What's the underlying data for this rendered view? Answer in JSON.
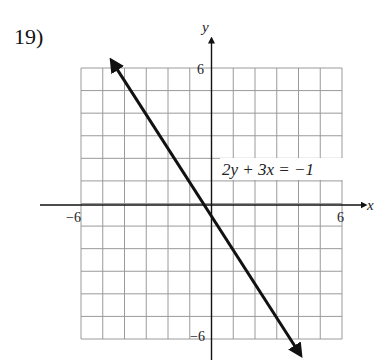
{
  "problem": {
    "number": "19)"
  },
  "chart_data": {
    "type": "line",
    "title": "",
    "equation_label": "2y + 3x = −1",
    "xlabel": "x",
    "ylabel": "y",
    "xlim": [
      -6,
      6
    ],
    "ylim": [
      -6,
      6
    ],
    "grid": true,
    "tick_labels": {
      "x_min": "−6",
      "x_max": "6",
      "y_min": "−6",
      "y_max": "6"
    },
    "series": [
      {
        "name": "2y + 3x = −1",
        "slope": -1.5,
        "intercept": -0.5,
        "x": [
          -4.5,
          4.0
        ],
        "y": [
          6.25,
          -6.5
        ]
      }
    ]
  }
}
